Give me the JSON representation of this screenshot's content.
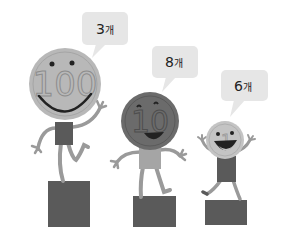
{
  "scene": {
    "description": "Three smiling coin characters standing on pedestals with speech bubbles",
    "colors": {
      "background": "#ffffff",
      "bubble": "#e6e6e6",
      "pedestal": "#5a5a5a",
      "limb": "#9a9a9a",
      "coin_100": "#b8b8b8",
      "coin_10": "#6b6b6b",
      "coin_1": "#c4c4c4",
      "text": "#222222"
    }
  },
  "characters": [
    {
      "coin_label": "100",
      "bubble_count": "3",
      "bubble_unit": "개"
    },
    {
      "coin_label": "10",
      "bubble_count": "8",
      "bubble_unit": "개"
    },
    {
      "coin_label": "1",
      "bubble_count": "6",
      "bubble_unit": "개"
    }
  ]
}
